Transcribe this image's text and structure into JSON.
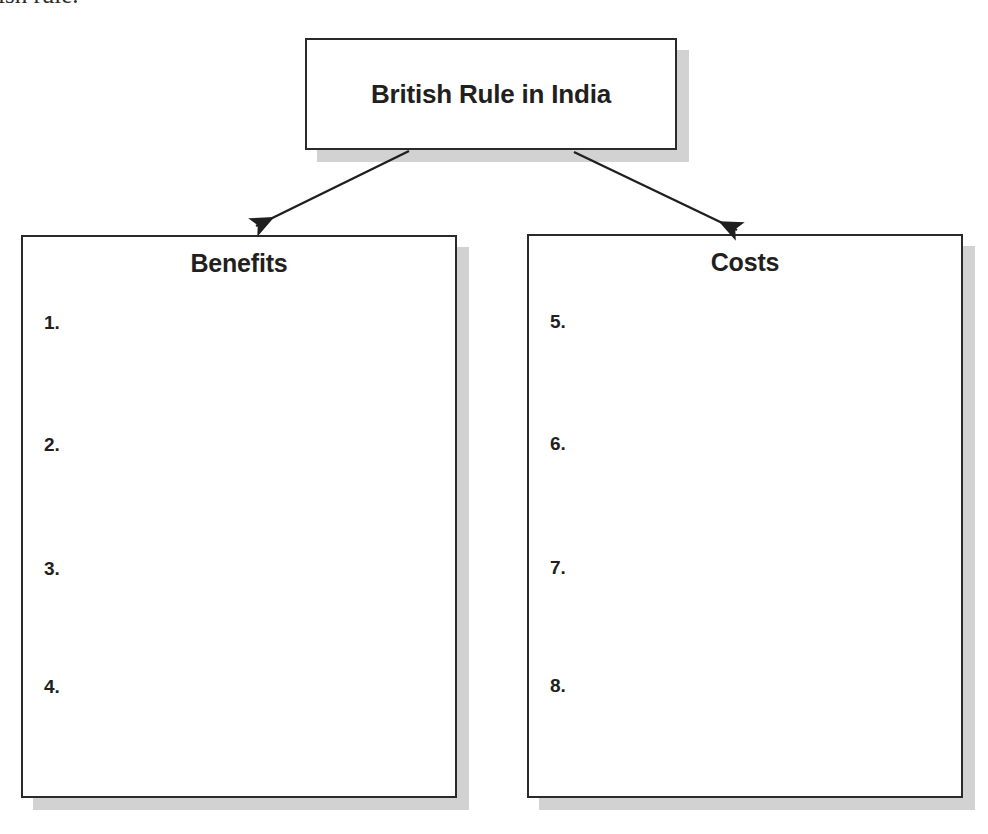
{
  "page": {
    "width": 988,
    "height": 834,
    "background_color": "#ffffff",
    "clipped_text_above": "ish rule.",
    "ink_color": "#231f20",
    "box_border_color": "#2a2a2a",
    "box_shadow_color": "#d2d2d2"
  },
  "organizer": {
    "title_box": {
      "label": "British Rule in India"
    },
    "columns": [
      {
        "heading": "Benefits",
        "items": [
          "1.",
          "2.",
          "3.",
          "4."
        ]
      },
      {
        "heading": "Costs",
        "items": [
          "5.",
          "6.",
          "7.",
          "8."
        ]
      }
    ],
    "connectors": [
      {
        "name": "arrow-to-benefits",
        "from": "title-box-bottom",
        "to": "benefits-box-top"
      },
      {
        "name": "arrow-to-costs",
        "from": "title-box-bottom",
        "to": "costs-box-top"
      }
    ]
  }
}
